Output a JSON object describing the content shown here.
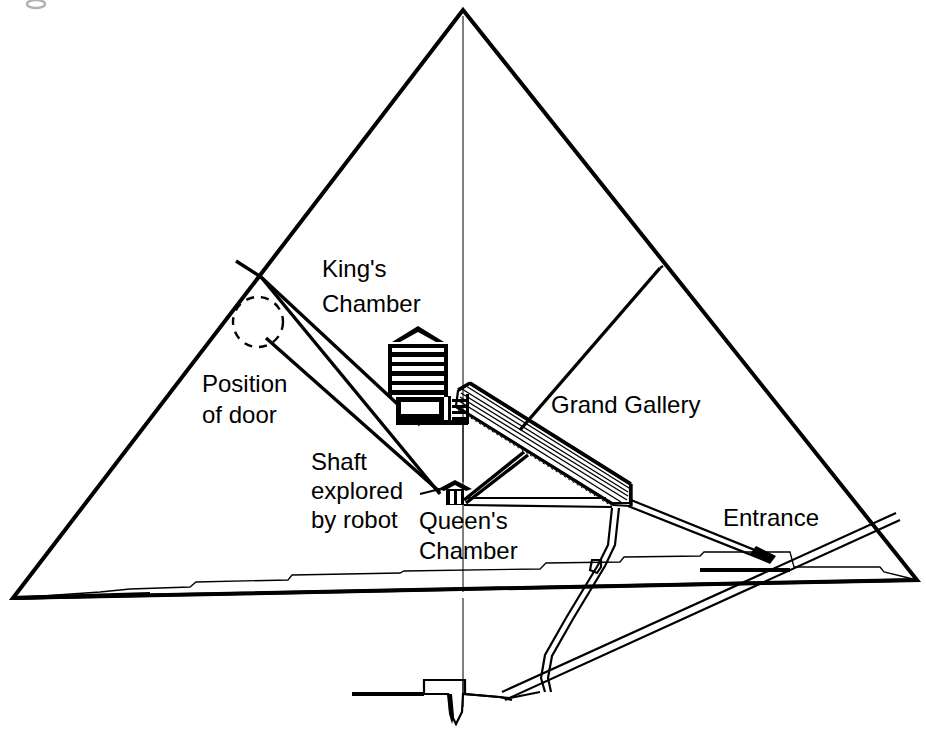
{
  "figure": {
    "background_color": "#ffffff",
    "line_color": "#000000",
    "width": 926,
    "height": 751
  },
  "labels": {
    "kings_chamber_line1": "King's",
    "kings_chamber_line2": "Chamber",
    "position_of_door_line1": "Position",
    "position_of_door_line2": "of door",
    "shaft_line1": "Shaft",
    "shaft_line2": "explored",
    "shaft_line3": "by robot",
    "queens_chamber_line1": "Queen's",
    "queens_chamber_line2": "Chamber",
    "grand_gallery": "Grand Gallery",
    "entrance": "Entrance"
  },
  "features": [
    {
      "name": "kings-chamber",
      "label": "King's Chamber"
    },
    {
      "name": "queens-chamber",
      "label": "Queen's Chamber"
    },
    {
      "name": "grand-gallery",
      "label": "Grand Gallery"
    },
    {
      "name": "entrance",
      "label": "Entrance"
    },
    {
      "name": "position-of-door",
      "label": "Position of door"
    },
    {
      "name": "shaft-explored-by-robot",
      "label": "Shaft explored by robot"
    }
  ]
}
